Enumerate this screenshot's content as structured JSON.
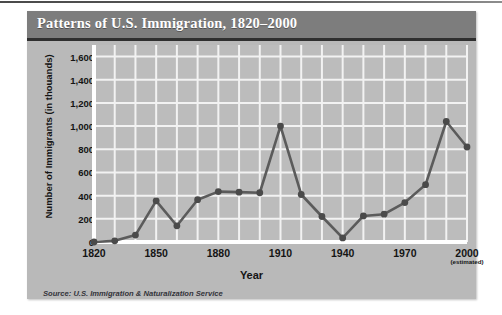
{
  "figure": {
    "title": "Patterns of U.S. Immigration, 1820–2000",
    "source": "Source: U.S. Immigration & Naturalization Service",
    "colors": {
      "title_bar": "#7d7d7d",
      "title_text": "#ffffff",
      "panel_background": "#b9b9b9",
      "plot_background": "#bcbcbc",
      "gridline": "#f2f2f2",
      "axis": "#ffffff",
      "series_line": "#5b5b5b",
      "marker": "#4a4a4a",
      "text": "#141414"
    }
  },
  "chart_data": {
    "type": "line",
    "title": "Patterns of U.S. Immigration, 1820–2000",
    "xlabel": "Year",
    "ylabel": "Number of Immigrants (in thouands)",
    "x": [
      1820,
      1830,
      1840,
      1850,
      1860,
      1870,
      1880,
      1890,
      1900,
      1910,
      1920,
      1930,
      1940,
      1950,
      1960,
      1970,
      1980,
      1990,
      2000
    ],
    "values": [
      0,
      10,
      60,
      355,
      140,
      365,
      435,
      430,
      425,
      1000,
      410,
      220,
      35,
      225,
      240,
      340,
      495,
      1040,
      820
    ],
    "series": [
      {
        "name": "Number of Immigrants (in thousands)",
        "values": [
          0,
          10,
          60,
          355,
          140,
          365,
          435,
          430,
          425,
          1000,
          410,
          220,
          35,
          225,
          240,
          340,
          495,
          1040,
          820
        ]
      }
    ],
    "xlim": [
      1820,
      2000
    ],
    "ylim": [
      0,
      1700
    ],
    "ytick_values": [
      0,
      200,
      400,
      600,
      800,
      1000,
      1200,
      1400,
      1600
    ],
    "ytick_labels": [
      "0",
      "200",
      "400",
      "600",
      "800",
      "1,000",
      "1,200",
      "1,400",
      "1,600"
    ],
    "xtick_values": [
      1820,
      1850,
      1880,
      1910,
      1940,
      1970,
      2000
    ],
    "xtick_labels": [
      "1820",
      "1850",
      "1880",
      "1910",
      "1940",
      "1970",
      "2000"
    ],
    "xtick_annotation": "(estimated)",
    "xtick_annotation_at": 2000,
    "minor_x_gridline_step": 10,
    "grid": true,
    "legend": "none",
    "marker": "circle",
    "annotations": [
      "Source: U.S. Immigration & Naturalization Service"
    ]
  }
}
